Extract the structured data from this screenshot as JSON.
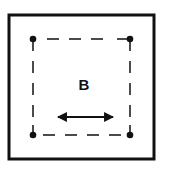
{
  "diagram": {
    "label": "B",
    "frame": "outer-square",
    "region": "dashed-square",
    "corner_points": [
      "top-left",
      "top-right",
      "bottom-left",
      "bottom-right"
    ],
    "arrow": "double-headed-horizontal",
    "colors": {
      "stroke": "#111111",
      "background": "#ffffff"
    }
  }
}
